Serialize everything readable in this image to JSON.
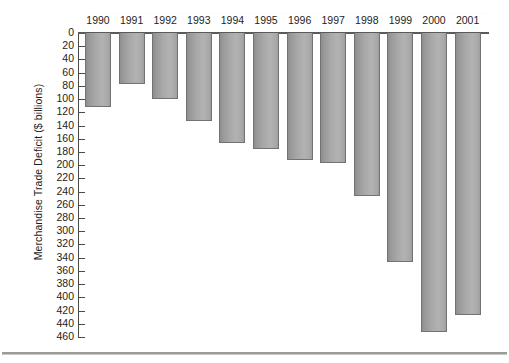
{
  "chart_data": {
    "type": "bar",
    "title": "",
    "xlabel": "",
    "ylabel": "Merchandise Trade Deficit ($ billions)",
    "orientation": "vertical-inverted",
    "grid": false,
    "legend": null,
    "ylim": [
      0,
      460
    ],
    "y_tick_step": 20,
    "y_ticks": [
      0,
      20,
      40,
      60,
      80,
      100,
      120,
      140,
      160,
      180,
      200,
      220,
      240,
      260,
      280,
      300,
      320,
      340,
      360,
      380,
      400,
      420,
      440,
      460
    ],
    "y_tick_labels": [
      "0",
      "20",
      "40",
      "60",
      "80",
      "100",
      "120",
      "140",
      "160",
      "180",
      "200",
      "220",
      "240",
      "260",
      "280",
      "300",
      "320",
      "340",
      "360",
      "380",
      "400",
      "420",
      "440",
      "460"
    ],
    "categories": [
      "1990",
      "1991",
      "1992",
      "1993",
      "1994",
      "1995",
      "1996",
      "1997",
      "1998",
      "1999",
      "2000",
      "2001"
    ],
    "values": [
      112,
      77,
      100,
      133,
      166,
      176,
      192,
      197,
      247,
      346,
      452,
      427
    ],
    "bar_color": "#a8a8a8",
    "bar_edge_color": "#737373",
    "axis_color": "#4a4a4a",
    "background_color": "#ffffff"
  },
  "axis": {
    "y_title": "Merchandise Trade Deficit ($ billions)"
  }
}
